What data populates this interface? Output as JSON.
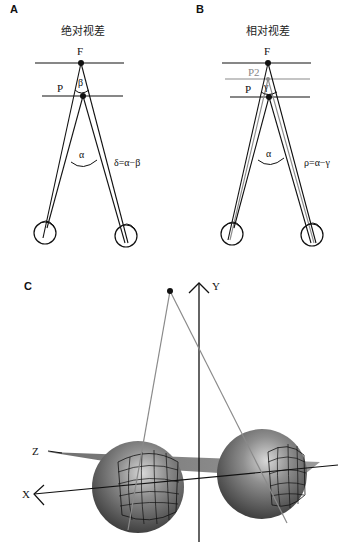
{
  "panels": {
    "a": {
      "letter": "A",
      "title": "绝对视差",
      "label_f": "F",
      "label_p": "P",
      "angle_beta": "β",
      "angle_alpha": "α",
      "equation": "δ=α−β"
    },
    "b": {
      "letter": "B",
      "title": "相对视差",
      "label_f": "F",
      "label_p2": "P2",
      "label_p": "P",
      "angle_gamma": "γ",
      "angle_alpha": "α",
      "equation": "ρ=α−γ"
    },
    "c": {
      "letter": "C",
      "axis_x": "X",
      "axis_y": "Y",
      "axis_z": "Z"
    }
  },
  "colors": {
    "line": "#111111",
    "gray_line": "#8a8a8a",
    "sphere_dark": "#3c3c3c",
    "sphere_light": "#bdbdbd"
  }
}
